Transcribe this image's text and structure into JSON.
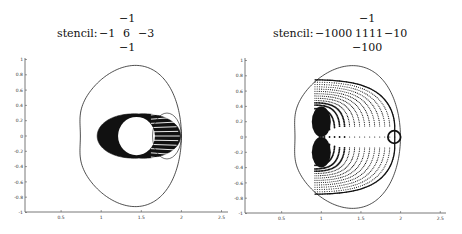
{
  "panels": [
    {
      "id": "left",
      "stencil": {
        "label": "stencil:",
        "top": "−1",
        "left": "−1",
        "center": "6",
        "right": "−3",
        "bottom": "−1"
      }
    },
    {
      "id": "right",
      "stencil": {
        "label": "stencil:",
        "top": "−1",
        "left": "−1000",
        "center": "1111",
        "right": "−10",
        "bottom": "−100"
      }
    }
  ],
  "chart_data": [
    {
      "type": "scatter",
      "title": "stencil: -1 (top), -1 6 -3 (row), -1 (bottom)",
      "xlabel": "",
      "ylabel": "",
      "xlim": [
        0,
        2.5
      ],
      "ylim": [
        -1,
        1
      ],
      "xticks": [
        0.5,
        1,
        1.5,
        2,
        2.5
      ],
      "xtick_labels": [
        "0.5",
        "1",
        "1.5",
        "2",
        "2.5"
      ],
      "yticks": [
        -1,
        -0.8,
        -0.6,
        -0.4,
        -0.2,
        0,
        0.2,
        0.4,
        0.6,
        0.8,
        1
      ],
      "ytick_labels": [
        "-1",
        "-0.8",
        "-0.6",
        "-0.4",
        "-0.2",
        "0",
        "0.2",
        "0.4",
        "0.6",
        "0.8",
        "1"
      ],
      "grid": false,
      "series": [
        {
          "name": "stability region boundary",
          "kind": "line",
          "description": "bean-shaped closed curve, leftmost indent at (0.67, 0), rightmost at (2.0, 0), top/bottom at y=±0.92 near x=1.25"
        },
        {
          "name": "eigenvalues",
          "kind": "dense points",
          "description": "dense cluster in x 0.95-2.0, y -0.32-0.32, with hollow disc centered near (1.25, 0) radius ~0.25 and radial striations toward x=2"
        }
      ]
    },
    {
      "type": "scatter",
      "title": "stencil: -1 (top), -1000 1111 -10 (row), -100 (bottom)",
      "xlabel": "",
      "ylabel": "",
      "xlim": [
        0,
        2.5
      ],
      "ylim": [
        -1,
        1
      ],
      "xticks": [
        0.5,
        1,
        1.5,
        2,
        2.5
      ],
      "xtick_labels": [
        "0.5",
        "1",
        "1.5",
        "2",
        "2.5"
      ],
      "yticks": [
        -1,
        -0.8,
        -0.6,
        -0.4,
        -0.2,
        0,
        0.2,
        0.4,
        0.6,
        0.8,
        1
      ],
      "ytick_labels": [
        "-1",
        "-0.8",
        "-0.6",
        "-0.4",
        "-0.2",
        "0",
        "0.2",
        "0.4",
        "0.6",
        "0.8",
        "1"
      ],
      "grid": false,
      "series": [
        {
          "name": "stability region boundary",
          "kind": "line",
          "description": "bean-shaped closed curve, leftmost indent at (0.6, 0), rightmost at (2.0, 0), top/bottom at y=±0.93 near x=1.25"
        },
        {
          "name": "eigenvalues",
          "kind": "nested arcs of points",
          "description": "concentric arcs of points from x 0.9-1.95, y -0.65-0.65, dense near x 0.9-1.1, two-lobed shape with cusps near (1.6, ±0.5), small circle centered at (1.92, 0) radius 0.08"
        }
      ]
    }
  ]
}
